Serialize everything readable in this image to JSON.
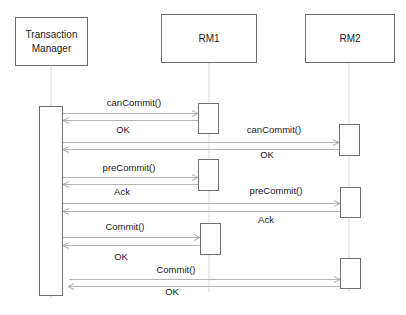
{
  "diagram": {
    "type": "sequence",
    "participants": [
      {
        "id": "tm",
        "label_line1": "Transaction",
        "label_line2": "Manager"
      },
      {
        "id": "rm1",
        "label": "RM1"
      },
      {
        "id": "rm2",
        "label": "RM2"
      }
    ],
    "messages": [
      {
        "from": "Transaction Manager",
        "to": "RM1",
        "label": "canCommit()",
        "reply": "OK"
      },
      {
        "from": "Transaction Manager",
        "to": "RM2",
        "label": "canCommit()",
        "reply": "OK"
      },
      {
        "from": "Transaction Manager",
        "to": "RM1",
        "label": "preCommit()",
        "reply": "Ack"
      },
      {
        "from": "Transaction Manager",
        "to": "RM2",
        "label": "preCommit()",
        "reply": "Ack"
      },
      {
        "from": "Transaction Manager",
        "to": "RM1",
        "label": "Commit()",
        "reply": "OK"
      },
      {
        "from": "Transaction Manager",
        "to": "RM2",
        "label": "Commit()",
        "reply": "OK"
      }
    ],
    "colors": {
      "box_border": "#6b6b6b",
      "lifeline": "#d8d8d8",
      "arrow": "#b4b4b4",
      "text": "#1a1a1a"
    }
  }
}
